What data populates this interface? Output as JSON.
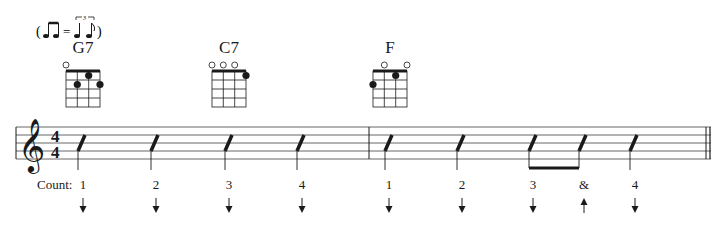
{
  "swing_indicator": {
    "text": "( ♫ = ♩ ♪ )",
    "tuplet": "3",
    "description": "swing eighths: two eighths equal triplet quarter-eighth"
  },
  "chords": [
    {
      "name": "G7",
      "open_strings": [
        1
      ],
      "dots": [
        {
          "string": 3,
          "fret": 1
        },
        {
          "string": 2,
          "fret": 2
        },
        {
          "string": 4,
          "fret": 2
        }
      ]
    },
    {
      "name": "C7",
      "open_strings": [
        1,
        2,
        3
      ],
      "dots": [
        {
          "string": 4,
          "fret": 1
        }
      ]
    },
    {
      "name": "F",
      "open_strings": [
        2,
        4
      ],
      "dots": [
        {
          "string": 3,
          "fret": 1
        },
        {
          "string": 1,
          "fret": 2
        }
      ]
    }
  ],
  "staff": {
    "clef": "treble",
    "time_signature": {
      "top": "4",
      "bottom": "4"
    },
    "measures": 2
  },
  "counting": {
    "label": "Count:",
    "beats": [
      {
        "text": "1",
        "strum": "down"
      },
      {
        "text": "2",
        "strum": "down"
      },
      {
        "text": "3",
        "strum": "down"
      },
      {
        "text": "4",
        "strum": "down"
      },
      {
        "text": "1",
        "strum": "down"
      },
      {
        "text": "2",
        "strum": "down"
      },
      {
        "text": "3",
        "strum": "down"
      },
      {
        "text": "&",
        "strum": "up"
      },
      {
        "text": "4",
        "strum": "down"
      }
    ]
  },
  "colors": {
    "ink": "#1a1a1a",
    "staff_line": "#555555",
    "background": "#ffffff"
  }
}
